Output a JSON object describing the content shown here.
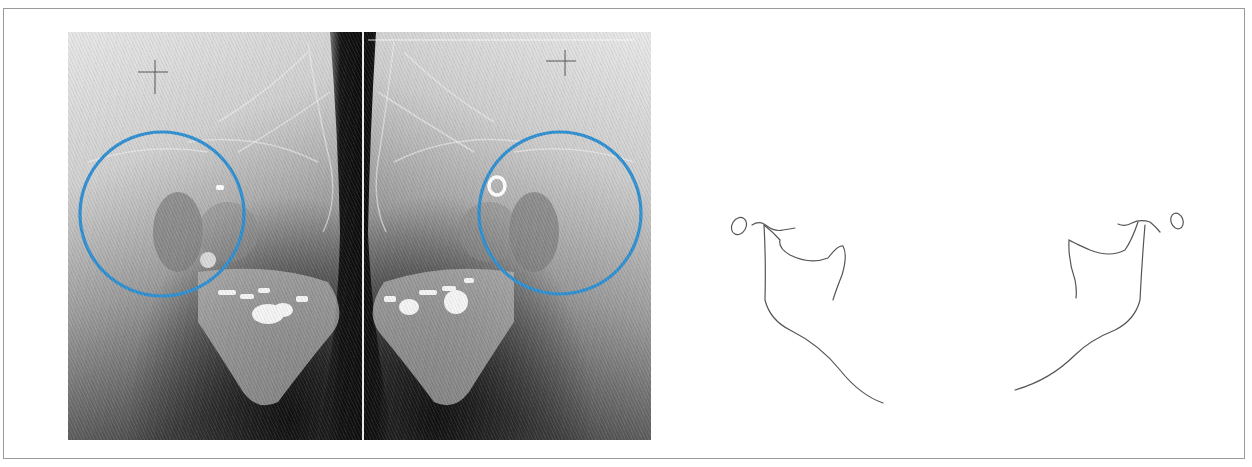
{
  "figure": {
    "panels": [
      {
        "id": "left-radiograph",
        "type": "radiograph",
        "view": "lateral oblique, left side",
        "annotation": {
          "shape": "circle",
          "color": "#2f8fd0",
          "cx": 162,
          "cy": 214,
          "r": 83
        },
        "markers": [
          "crosshair",
          "small-bright-marker"
        ]
      },
      {
        "id": "right-radiograph",
        "type": "radiograph",
        "view": "lateral oblique, right side (mirrored)",
        "annotation": {
          "shape": "circle",
          "color": "#2f8fd0",
          "cx": 560,
          "cy": 213,
          "r": 82
        },
        "markers": [
          "crosshair",
          "ring-marker"
        ]
      },
      {
        "id": "tracing",
        "type": "line-drawing",
        "content": [
          "left mandible outline tracing",
          "right mandible outline tracing"
        ],
        "line_color": "#555555"
      }
    ],
    "colors": {
      "annotation_blue": "#2f8fd0",
      "frame_border": "#9a9a9a",
      "background": "#ffffff"
    }
  }
}
